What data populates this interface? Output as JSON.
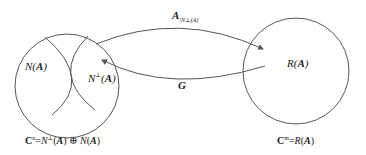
{
  "diagram": {
    "left_set": {
      "shape": "circle",
      "regions": [
        {
          "id": "null-space",
          "label_base": "N",
          "label_arg": "A"
        },
        {
          "id": "null-space-complement",
          "label_base": "N",
          "label_sup": "⊥",
          "label_arg": "A"
        }
      ],
      "caption": {
        "space": "C",
        "space_sup": "n",
        "eq": "=",
        "term1_base": "N",
        "term1_sup": "⊥",
        "term1_arg": "A",
        "op": "⊕",
        "term2_base": "N",
        "term2_arg": "A"
      }
    },
    "right_set": {
      "shape": "circle",
      "region_label_base": "R",
      "region_label_arg": "A",
      "caption": {
        "space": "C",
        "space_sup": "m",
        "eq": "=",
        "term_base": "R",
        "term_arg": "A"
      }
    },
    "arrows": [
      {
        "id": "restricted-map",
        "direction": "left-to-right",
        "label_base": "A",
        "label_sub": "|N⊥(A)"
      },
      {
        "id": "generalized-inverse",
        "direction": "right-to-left",
        "label": "G"
      }
    ],
    "colors": {
      "stroke": "#555555",
      "text": "#222222",
      "background": "#ffffff"
    }
  }
}
